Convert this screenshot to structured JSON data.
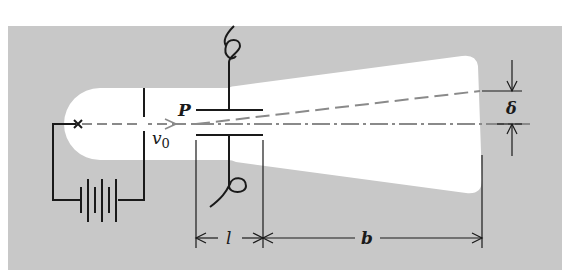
{
  "figure": {
    "colors": {
      "background": "#c8c8c8",
      "tube": "#ffffff",
      "lines": "#1a1a1a",
      "beam": "#8a8a8a"
    }
  },
  "labels": {
    "plate": "P",
    "velocity": "v",
    "velocity_sub": "0",
    "deflection": "δ",
    "plate_length": "l",
    "distance_to_screen": "b"
  },
  "components": [
    {
      "name": "cathode",
      "symbol": "×"
    },
    {
      "name": "anode"
    },
    {
      "name": "battery"
    },
    {
      "name": "deflection-plate-top"
    },
    {
      "name": "deflection-plate-bottom"
    },
    {
      "name": "screen"
    }
  ]
}
